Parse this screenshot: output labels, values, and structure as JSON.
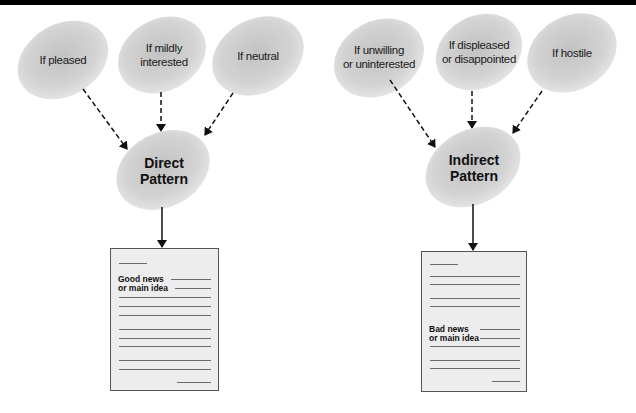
{
  "direct": {
    "reactions": [
      {
        "label_line1": "If pleased",
        "label_line2": ""
      },
      {
        "label_line1": "If mildly",
        "label_line2": "interested"
      },
      {
        "label_line1": "If neutral",
        "label_line2": ""
      }
    ],
    "pattern": {
      "line1": "Direct",
      "line2": "Pattern"
    },
    "document": {
      "line1": "Good news",
      "line2": "or main idea"
    }
  },
  "indirect": {
    "reactions": [
      {
        "label_line1": "If unwilling",
        "label_line2": "or uninterested"
      },
      {
        "label_line1": "If displeased",
        "label_line2": "or disappointed"
      },
      {
        "label_line1": "If hostile",
        "label_line2": ""
      }
    ],
    "pattern": {
      "line1": "Indirect",
      "line2": "Pattern"
    },
    "document": {
      "line1": "Bad news",
      "line2": "or main idea"
    }
  },
  "colors": {
    "ellipse": "#d4d4d4",
    "ellipse_dark": "#bdbdbd",
    "doc_fill": "#ededed",
    "arrow": "#111111"
  }
}
